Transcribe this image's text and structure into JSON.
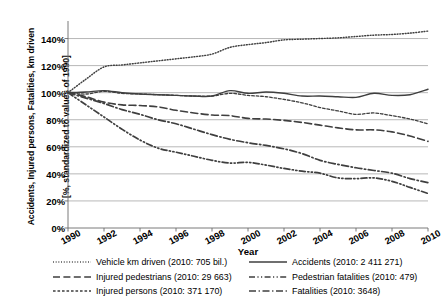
{
  "axes": {
    "y_label_line1": "Accidents, Injured persons, Fatalities, km driven",
    "y_label_line2": "[%, standardized to values of 1990]",
    "x_label": "Year",
    "y_ticks": [
      "0%",
      "20%",
      "40%",
      "60%",
      "80%",
      "100%",
      "120%",
      "140%"
    ],
    "x_ticks": [
      "1990",
      "1992",
      "1994",
      "1996",
      "1998",
      "2000",
      "2002",
      "2004",
      "2006",
      "2008",
      "2010"
    ]
  },
  "legend": {
    "left": [
      {
        "label": "Vehicle km driven (2010: 705 bil.)",
        "style": "dotted"
      },
      {
        "label": "Injured pedestrians (2010: 29 663)",
        "style": "longdash"
      },
      {
        "label": "Injured persons (2010: 371 170)",
        "style": "shortdash"
      }
    ],
    "right": [
      {
        "label": "Accidents (2010: 2 411 271)",
        "style": "solid"
      },
      {
        "label": "Pedestrian fatalities (2010: 479)",
        "style": "dashdotdot"
      },
      {
        "label": "Fatalities (2010: 3648)",
        "style": "dashdot"
      }
    ]
  },
  "colors": {
    "ink": "#3f3f3f",
    "grid": "#9a9a9a",
    "axis": "#6b6b6b",
    "background": "#ffffff"
  },
  "chart_data": {
    "type": "line",
    "title": "",
    "xlabel": "Year",
    "ylabel": "Accidents, Injured persons, Fatalities, km driven [%, standardized to values of 1990]",
    "xlim": [
      1990,
      2010
    ],
    "ylim": [
      0,
      150
    ],
    "grid": true,
    "legend_position": "below",
    "x": [
      1990,
      1991,
      1992,
      1993,
      1994,
      1995,
      1996,
      1997,
      1998,
      1999,
      2000,
      2001,
      2002,
      2003,
      2004,
      2005,
      2006,
      2007,
      2008,
      2009,
      2010
    ],
    "series": [
      {
        "name": "Vehicle km driven (2010: 705 bil.)",
        "style": "dotted",
        "values": [
          100,
          110,
          119,
          120.5,
          122,
          123.5,
          125,
          126.5,
          128.5,
          133.5,
          135.5,
          137,
          139,
          139.5,
          140,
          140.5,
          141.5,
          142.5,
          143,
          144,
          145.5
        ]
      },
      {
        "name": "Accidents (2010: 2 411 271)",
        "style": "solid",
        "values": [
          100,
          100.5,
          101.5,
          100,
          99,
          98.5,
          98,
          97.5,
          97.5,
          101.5,
          99.5,
          100.5,
          99.5,
          97.5,
          97.5,
          97,
          96.5,
          99.5,
          98,
          98.5,
          102.5
        ]
      },
      {
        "name": "Injured persons (2010: 371 170)",
        "style": "shortdash",
        "values": [
          100,
          99,
          101,
          99.5,
          99,
          98.5,
          98,
          97.5,
          97.5,
          99.5,
          98,
          97,
          95,
          92.5,
          89,
          86.5,
          84,
          85,
          83,
          80.5,
          77
        ]
      },
      {
        "name": "Injured pedestrians (2010: 29 663)",
        "style": "longdash",
        "values": [
          100,
          97,
          93,
          91,
          90.5,
          89.5,
          87,
          85,
          83.5,
          83,
          81,
          80.5,
          79.5,
          78,
          76,
          74,
          72.5,
          72.5,
          71,
          68,
          64
        ]
      },
      {
        "name": "Fatalities (2010: 3648)",
        "style": "dashdot",
        "values": [
          100,
          96,
          92,
          87.5,
          84,
          80,
          77,
          73,
          69,
          65.5,
          63,
          61,
          58.5,
          55,
          50,
          47,
          44.5,
          42.5,
          40.5,
          36.5,
          33.5
        ]
      },
      {
        "name": "Pedestrian fatalities (2010: 479)",
        "style": "dashdotdot",
        "values": [
          100,
          91,
          82,
          73,
          65,
          59,
          56,
          53,
          50,
          48,
          48.5,
          46.5,
          44,
          42,
          40.5,
          37,
          36.5,
          37,
          34.5,
          30,
          25.5
        ]
      }
    ]
  }
}
